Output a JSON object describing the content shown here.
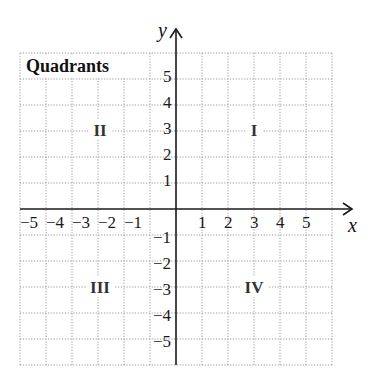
{
  "diagram": {
    "title": "Quadrants",
    "axes": {
      "x_label": "x",
      "y_label": "y",
      "x_ticks": [
        "−5",
        "−4",
        "−3",
        "−2",
        "−1",
        "1",
        "2",
        "3",
        "4",
        "5"
      ],
      "y_ticks_positive": [
        "5",
        "4",
        "3",
        "2",
        "1"
      ],
      "y_ticks_negative": [
        "−1",
        "−2",
        "−3",
        "−4",
        "−5"
      ],
      "range": [
        -6,
        6
      ]
    },
    "quadrants": {
      "I": "I",
      "II": "II",
      "III": "III",
      "IV": "IV"
    },
    "colors": {
      "axis": "#1a1a1a",
      "grid": "#9a9a9a",
      "background": "#ffffff"
    }
  }
}
